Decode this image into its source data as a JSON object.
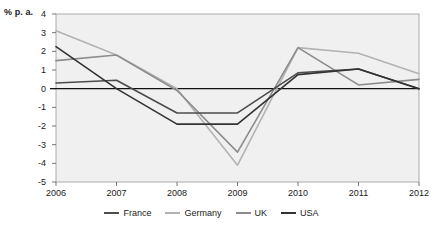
{
  "chart_data": {
    "type": "line",
    "title": "",
    "subtitle": "",
    "xlabel": "",
    "ylabel": "% p. a.",
    "categories": [
      "2006",
      "2007",
      "2008",
      "2009",
      "2010",
      "2011",
      "2012"
    ],
    "x": [
      2006,
      2007,
      2008,
      2009,
      2010,
      2011,
      2012
    ],
    "ylim": [
      -5,
      4
    ],
    "ytick_labels": [
      "4",
      "3",
      "2",
      "1",
      "0",
      "-1",
      "-2",
      "-3",
      "-4",
      "-5"
    ],
    "ytick_values": [
      4,
      3,
      2,
      1,
      0,
      -1,
      -2,
      -3,
      -4,
      -5
    ],
    "grid": false,
    "zero_line": true,
    "legend_position": "bottom",
    "plot_background": "#f0f0f0",
    "series": [
      {
        "name": "France",
        "color": "#4d4d4d",
        "values": [
          0.3,
          0.45,
          -1.3,
          -1.3,
          0.85,
          1.05,
          0.0
        ]
      },
      {
        "name": "Germany",
        "color": "#b3b3b3",
        "values": [
          3.1,
          1.8,
          0.0,
          -4.1,
          2.2,
          1.9,
          0.8
        ]
      },
      {
        "name": "UK",
        "color": "#8c8c8c",
        "values": [
          1.5,
          1.8,
          -0.1,
          -3.4,
          2.2,
          0.2,
          0.5
        ]
      },
      {
        "name": "USA",
        "color": "#333333",
        "values": [
          2.25,
          0.0,
          -1.9,
          -1.9,
          0.75,
          1.05,
          0.0
        ]
      }
    ]
  },
  "legend": {
    "items": [
      {
        "label": "France",
        "color": "#4d4d4d"
      },
      {
        "label": "Germany",
        "color": "#b3b3b3"
      },
      {
        "label": "UK",
        "color": "#8c8c8c"
      },
      {
        "label": "USA",
        "color": "#333333"
      }
    ]
  }
}
